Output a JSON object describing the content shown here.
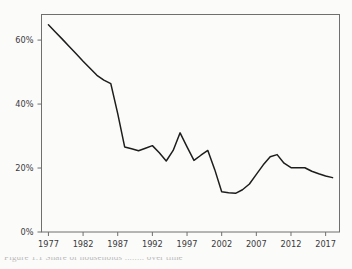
{
  "figure": {
    "background_color": "#fbfbfa",
    "line_color": "#1d1d1d",
    "axis_color": "#6f6f6f",
    "caption_fragment": "Figure 1.1  Share of households ........ over time"
  },
  "chart_data": {
    "type": "line",
    "title": "",
    "subtitle": "",
    "xlabel": "",
    "ylabel": "",
    "xlim": [
      1976,
      2019
    ],
    "ylim": [
      0,
      68
    ],
    "grid": false,
    "legend": false,
    "legend_position": "none",
    "y_tick_labels": [
      "0%",
      "20%",
      "40%",
      "60%"
    ],
    "y_ticks": [
      0,
      20,
      40,
      60
    ],
    "x_tick_labels": [
      "1977",
      "1982",
      "1987",
      "1992",
      "1997",
      "2002",
      "2007",
      "2012",
      "2017"
    ],
    "x_ticks": [
      1977,
      1982,
      1987,
      1992,
      1997,
      2002,
      2007,
      2012,
      2017
    ],
    "series": [
      {
        "name": "share",
        "x": [
          1977,
          1978,
          1979,
          1980,
          1981,
          1982,
          1983,
          1984,
          1985,
          1986,
          1987,
          1988,
          1989,
          1990,
          1991,
          1992,
          1993,
          1994,
          1995,
          1996,
          1997,
          1998,
          1999,
          2000,
          2001,
          2002,
          2003,
          2004,
          2005,
          2006,
          2007,
          2008,
          2009,
          2010,
          2011,
          2012,
          2013,
          2014,
          2015,
          2016,
          2017,
          2018
        ],
        "values": [
          64.8,
          62.5,
          60.3,
          58.0,
          55.7,
          53.4,
          51.2,
          49.0,
          47.5,
          46.4,
          37.0,
          26.6,
          26.0,
          25.4,
          26.2,
          27.0,
          24.8,
          22.2,
          25.5,
          31.0,
          26.6,
          22.4,
          24.0,
          25.5,
          19.5,
          12.6,
          12.3,
          12.1,
          13.2,
          15.0,
          18.0,
          21.0,
          23.5,
          24.2,
          21.5,
          20.1,
          20.1,
          20.1,
          19.0,
          18.2,
          17.5,
          17.0
        ]
      }
    ]
  }
}
